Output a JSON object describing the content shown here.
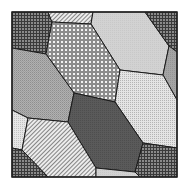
{
  "figure": {
    "frame": {
      "x": 12,
      "y": 12,
      "w": 165,
      "h": 165,
      "stroke": "#222222"
    },
    "cells": [
      {
        "name": "top-left-crosshatch",
        "pattern": "crosshatch-dark",
        "points": "12,12 48,12 52,22 46,54 12,48"
      },
      {
        "name": "top-stripes",
        "pattern": "stripes",
        "points": "48,12 93,12 91,24 52,22"
      },
      {
        "name": "top-light",
        "pattern": "light-solid",
        "points": "93,12 145,12 169,46 163,75 120,70 91,24"
      },
      {
        "name": "top-right-crosshatch",
        "pattern": "crosshatch-dark",
        "points": "145,12 177,12 177,52 169,46"
      },
      {
        "name": "right-sliver",
        "pattern": "mid-solid",
        "points": "169,46 177,52 177,100 163,75"
      },
      {
        "name": "center-dots",
        "pattern": "dots",
        "points": "52,22 91,24 120,70 115,102 74,93 46,54"
      },
      {
        "name": "left-mid-gray",
        "pattern": "mid-dither",
        "points": "12,48 46,54 74,93 68,122 28,118 12,110"
      },
      {
        "name": "right-light-dots",
        "pattern": "light-dots",
        "points": "120,70 163,75 177,100 177,148 143,143 115,102"
      },
      {
        "name": "center-dark",
        "pattern": "dark-solid",
        "points": "74,93 115,102 143,143 135,172 96,168 68,122"
      },
      {
        "name": "left-small-light",
        "pattern": "light-dither",
        "points": "12,110 28,118 22,150 12,148"
      },
      {
        "name": "bottom-stripes",
        "pattern": "stripes",
        "points": "28,118 68,122 96,168 96,177 48,177 22,150"
      },
      {
        "name": "bottom-left-crosshatch",
        "pattern": "crosshatch-dark",
        "points": "12,148 22,150 48,177 12,177"
      },
      {
        "name": "bottom-light",
        "pattern": "light-solid",
        "points": "96,168 135,172 140,177 96,177"
      },
      {
        "name": "bottom-right-crosshatch",
        "pattern": "crosshatch-dark",
        "points": "143,143 177,148 177,177 140,177 135,172"
      }
    ],
    "colors": {
      "stroke": "#1a1a1a",
      "dark": "#555555",
      "mid": "#9a9a9a",
      "light": "#cfcfcf",
      "lighter": "#e2e2e2",
      "white": "#ffffff"
    }
  }
}
